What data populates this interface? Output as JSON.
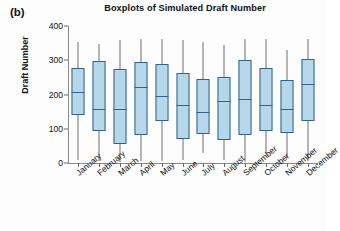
{
  "panel": {
    "label": "(b)"
  },
  "chart_data": {
    "type": "boxplot",
    "title": "Boxplots of Simulated Draft Number",
    "xlabel": "",
    "ylabel": "Draft Number",
    "ylim": [
      0,
      400
    ],
    "yticks": [
      0,
      100,
      200,
      300,
      400
    ],
    "grid": false,
    "legend": null,
    "categories": [
      "January",
      "February",
      "March",
      "April",
      "May",
      "June",
      "July",
      "August",
      "September",
      "October",
      "November",
      "December"
    ],
    "boxes": [
      {
        "category": "January",
        "whisker_low": 10,
        "q1": 141,
        "median": 206,
        "q3": 278,
        "whisker_high": 352
      },
      {
        "category": "February",
        "whisker_low": 6,
        "q1": 93,
        "median": 157,
        "q3": 297,
        "whisker_high": 348
      },
      {
        "category": "March",
        "whisker_low": 4,
        "q1": 54,
        "median": 157,
        "q3": 274,
        "whisker_high": 360
      },
      {
        "category": "April",
        "whisker_low": 5,
        "q1": 81,
        "median": 222,
        "q3": 295,
        "whisker_high": 361
      },
      {
        "category": "May",
        "whisker_low": 5,
        "q1": 123,
        "median": 195,
        "q3": 288,
        "whisker_high": 363
      },
      {
        "category": "June",
        "whisker_low": 9,
        "q1": 71,
        "median": 169,
        "q3": 262,
        "whisker_high": 358
      },
      {
        "category": "July",
        "whisker_low": 29,
        "q1": 84,
        "median": 148,
        "q3": 245,
        "whisker_high": 353
      },
      {
        "category": "August",
        "whisker_low": 10,
        "q1": 67,
        "median": 182,
        "q3": 250,
        "whisker_high": 345
      },
      {
        "category": "September",
        "whisker_low": 4,
        "q1": 82,
        "median": 187,
        "q3": 301,
        "whisker_high": 363
      },
      {
        "category": "October",
        "whisker_low": 29,
        "q1": 93,
        "median": 169,
        "q3": 278,
        "whisker_high": 362
      },
      {
        "category": "November",
        "whisker_low": 16,
        "q1": 88,
        "median": 159,
        "q3": 243,
        "whisker_high": 331
      },
      {
        "category": "December",
        "whisker_low": 7,
        "q1": 124,
        "median": 232,
        "q3": 305,
        "whisker_high": 362
      }
    ],
    "colors": {
      "box_fill": "#b6d7ea",
      "box_edge": "#33628c",
      "whisker": "#6f6f6f",
      "axis": "#8a8a8a"
    }
  }
}
